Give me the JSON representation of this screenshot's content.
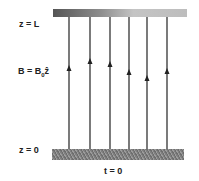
{
  "labels": {
    "top": "z = L",
    "bottom": "z = 0",
    "field_prefix": "B = B",
    "field_sub": "0",
    "field_vec": "ẑ",
    "time": "t = 0"
  },
  "field_lines": [
    {
      "x": 69,
      "arrow_y": 69
    },
    {
      "x": 90,
      "arrow_y": 62
    },
    {
      "x": 110,
      "arrow_y": 65
    },
    {
      "x": 129,
      "arrow_y": 73
    },
    {
      "x": 147,
      "arrow_y": 79
    },
    {
      "x": 167,
      "arrow_y": 72
    }
  ]
}
